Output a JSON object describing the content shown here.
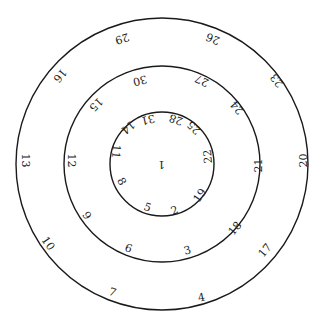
{
  "diagram": {
    "type": "concentric-circles-number-dial",
    "colors": {
      "stroke": "#1a1a1a",
      "text": "#222222",
      "background": "#ffffff"
    },
    "center": {
      "x": 162,
      "y": 164
    },
    "rings": [
      {
        "name": "outer",
        "radius": 146
      },
      {
        "name": "middle",
        "radius": 98
      },
      {
        "name": "inner",
        "radius": 52
      }
    ],
    "center_label": {
      "text": "1",
      "x": 161,
      "y": 164,
      "rot": 180
    },
    "labels": [
      {
        "text": "29",
        "x": 122,
        "y": 38,
        "rot": 163
      },
      {
        "text": "26",
        "x": 213,
        "y": 38,
        "rot": -158
      },
      {
        "text": "16",
        "x": 60,
        "y": 75,
        "rot": 130
      },
      {
        "text": "23",
        "x": 277,
        "y": 80,
        "rot": -128
      },
      {
        "text": "13",
        "x": 25,
        "y": 160,
        "rot": 90
      },
      {
        "text": "20",
        "x": 303,
        "y": 160,
        "rot": -90
      },
      {
        "text": "10",
        "x": 48,
        "y": 243,
        "rot": 55
      },
      {
        "text": "17",
        "x": 265,
        "y": 250,
        "rot": -50
      },
      {
        "text": "7",
        "x": 112,
        "y": 292,
        "rot": 20
      },
      {
        "text": "4",
        "x": 201,
        "y": 297,
        "rot": -12
      },
      {
        "text": "30",
        "x": 140,
        "y": 80,
        "rot": 165
      },
      {
        "text": "27",
        "x": 202,
        "y": 80,
        "rot": -155
      },
      {
        "text": "15",
        "x": 96,
        "y": 104,
        "rot": 135
      },
      {
        "text": "24",
        "x": 237,
        "y": 107,
        "rot": -130
      },
      {
        "text": "12",
        "x": 71,
        "y": 160,
        "rot": 90
      },
      {
        "text": "21",
        "x": 258,
        "y": 165,
        "rot": -90
      },
      {
        "text": "9",
        "x": 86,
        "y": 215,
        "rot": 55
      },
      {
        "text": "18",
        "x": 235,
        "y": 228,
        "rot": -50
      },
      {
        "text": "6",
        "x": 128,
        "y": 248,
        "rot": 20
      },
      {
        "text": "3",
        "x": 187,
        "y": 250,
        "rot": -15
      },
      {
        "text": "31",
        "x": 148,
        "y": 119,
        "rot": 168
      },
      {
        "text": "28",
        "x": 176,
        "y": 119,
        "rot": -160
      },
      {
        "text": "14",
        "x": 128,
        "y": 127,
        "rot": 140
      },
      {
        "text": "25",
        "x": 194,
        "y": 127,
        "rot": -135
      },
      {
        "text": "11",
        "x": 116,
        "y": 151,
        "rot": 95
      },
      {
        "text": "22",
        "x": 208,
        "y": 156,
        "rot": -95
      },
      {
        "text": "8",
        "x": 121,
        "y": 181,
        "rot": 60
      },
      {
        "text": "19",
        "x": 200,
        "y": 195,
        "rot": -55
      },
      {
        "text": "5",
        "x": 147,
        "y": 207,
        "rot": 20
      },
      {
        "text": "2",
        "x": 174,
        "y": 210,
        "rot": -20
      }
    ]
  }
}
